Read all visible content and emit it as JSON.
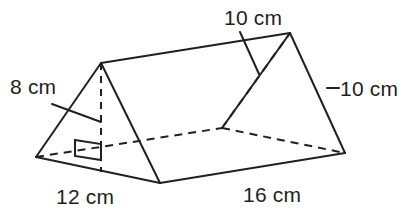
{
  "figure": {
    "name": "triangular-prism-diagram",
    "shape": "triangular prism",
    "unit": "cm",
    "stroke_color": "#231f20",
    "background_color": "#ffffff",
    "labels": {
      "slant_height": "8 cm",
      "top_slant_edge": "10 cm",
      "right_slant_edge": "10 cm",
      "base_width": "12 cm",
      "prism_length": "16 cm"
    },
    "measurements": [
      {
        "id": "slant-height",
        "value": 8,
        "unit": "cm",
        "text": "8 cm"
      },
      {
        "id": "top-slant-edge",
        "value": 10,
        "unit": "cm",
        "text": "10 cm"
      },
      {
        "id": "right-slant-edge",
        "value": 10,
        "unit": "cm",
        "text": "10 cm"
      },
      {
        "id": "base-width",
        "value": 12,
        "unit": "cm",
        "text": "12 cm"
      },
      {
        "id": "prism-length",
        "value": 16,
        "unit": "cm",
        "text": "16 cm"
      }
    ],
    "annotations": {
      "right_angle_marker": "right-angle-symbol"
    }
  }
}
